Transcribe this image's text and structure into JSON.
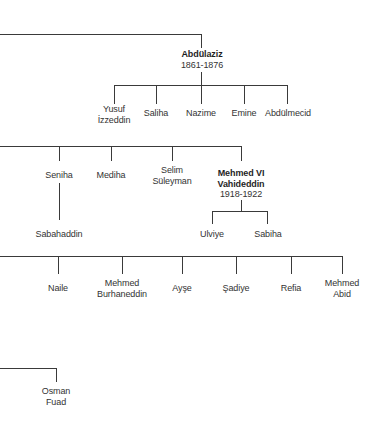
{
  "diagram": {
    "type": "family-tree",
    "branches": [
      {
        "parent": {
          "name": "Abdülaziz",
          "reign": "1861-1876",
          "ruler": true
        },
        "children": [
          {
            "name_lines": [
              "Yusuf",
              "İzzeddin"
            ]
          },
          {
            "name_lines": [
              "Saliha"
            ]
          },
          {
            "name_lines": [
              "Nazime"
            ]
          },
          {
            "name_lines": [
              "Emine"
            ]
          },
          {
            "name_lines": [
              "Abdülmecid"
            ]
          }
        ]
      },
      {
        "siblings": [
          {
            "name_lines": [
              "Seniha"
            ],
            "children": [
              {
                "name_lines": [
                  "Sabahaddin"
                ]
              }
            ]
          },
          {
            "name_lines": [
              "Mediha"
            ]
          },
          {
            "name_lines": [
              "Selim",
              "Süleyman"
            ]
          },
          {
            "name_lines": [
              "Mehmed VI",
              "Vahideddin"
            ],
            "reign": "1918-1922",
            "ruler": true,
            "children": [
              {
                "name_lines": [
                  "Ulviye"
                ]
              },
              {
                "name_lines": [
                  "Sabiha"
                ]
              }
            ]
          }
        ]
      },
      {
        "siblings": [
          {
            "name_lines": [
              "Naile"
            ]
          },
          {
            "name_lines": [
              "Mehmed",
              "Burhaneddin"
            ]
          },
          {
            "name_lines": [
              "Ayşe"
            ]
          },
          {
            "name_lines": [
              "Şadiye"
            ]
          },
          {
            "name_lines": [
              "Refia"
            ]
          },
          {
            "name_lines": [
              "Mehmed",
              "Abid"
            ]
          }
        ]
      },
      {
        "siblings": [
          {
            "name_lines": [
              "Osman",
              "Fuad"
            ]
          }
        ]
      }
    ]
  },
  "labels": {
    "abdulaziz": "Abdülaziz",
    "abdulaziz_reign": "1861-1876",
    "yusuf_1": "Yusuf",
    "yusuf_2": "İzzeddin",
    "saliha": "Saliha",
    "nazime": "Nazime",
    "emine": "Emine",
    "abdulmecid": "Abdülmecid",
    "seniha": "Seniha",
    "sabahaddin": "Sabahaddin",
    "mediha": "Mediha",
    "selim_1": "Selim",
    "selim_2": "Süleyman",
    "mehmed6_1": "Mehmed VI",
    "mehmed6_2": "Vahideddin",
    "mehmed6_reign": "1918-1922",
    "ulviye": "Ulviye",
    "sabiha": "Sabiha",
    "naile": "Naile",
    "burhaneddin_1": "Mehmed",
    "burhaneddin_2": "Burhaneddin",
    "ayse": "Ayşe",
    "sadiye": "Şadiye",
    "refia": "Refia",
    "abid_1": "Mehmed",
    "abid_2": "Abid",
    "osman_1": "Osman",
    "osman_2": "Fuad"
  },
  "colors": {
    "line": "#3a3a3a",
    "text": "#333333",
    "background": "#ffffff"
  }
}
